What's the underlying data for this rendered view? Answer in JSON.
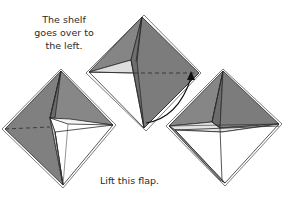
{
  "diagram": {
    "type": "origami-instructions",
    "captions": {
      "top_left": "The shelf goes over to the left.",
      "top_left_lines": [
        "The shelf",
        "goes over to",
        "the left."
      ],
      "bottom": "Lift this flap."
    },
    "colors": {
      "paper_dark": "#7a7a7a",
      "paper_mid": "#8c8c8c",
      "paper_light": "#e2e2e2",
      "white": "#ffffff",
      "line": "#2a2a2a"
    },
    "figures": [
      {
        "id": "left",
        "label": "folded model, shelf to left"
      },
      {
        "id": "middle",
        "label": "folded model with arrow showing shelf move"
      },
      {
        "id": "right",
        "label": "folded model, flap lifted"
      }
    ]
  }
}
